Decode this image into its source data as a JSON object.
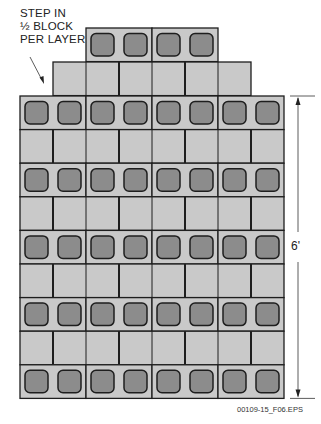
{
  "annotation": {
    "lines": [
      "STEP IN",
      "½ BLOCK",
      "PER LAYER"
    ]
  },
  "dimension": {
    "label": "6'"
  },
  "figure_id": "00109-15_F06.EPS",
  "colors": {
    "block_fill": "#c9c9c9",
    "core_fill": "#8c8c8c",
    "outline": "#1e1e1e",
    "background": "#ffffff"
  },
  "layout": {
    "wall_left": 20,
    "wall_right": 284,
    "block_width": 66,
    "course_height": 33.6,
    "main_top": 96,
    "main_courses": 9,
    "step_courses": [
      {
        "left": 86,
        "right": 218,
        "top": 28,
        "type": "cores"
      },
      {
        "left": 53,
        "right": 251,
        "top": 62,
        "type": "face"
      }
    ]
  }
}
